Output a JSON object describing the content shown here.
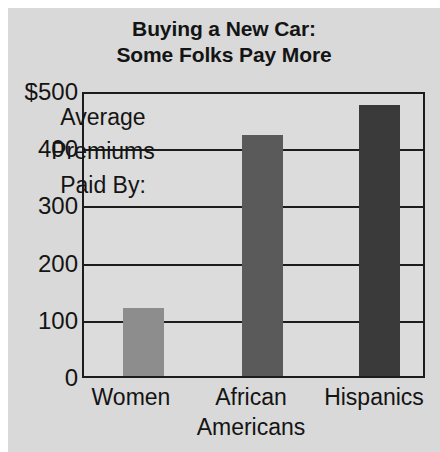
{
  "chart_data": {
    "type": "bar",
    "title": "Buying a New Car: Some Folks Pay More",
    "title_line1": "Buying a New Car:",
    "title_line2": "Some Folks Pay More",
    "categories": [
      "Women",
      "African Americans",
      "Hispanics"
    ],
    "category_lines": [
      [
        "Women"
      ],
      [
        "African",
        "Americans"
      ],
      [
        "Hispanics"
      ]
    ],
    "values": [
      120,
      428,
      480
    ],
    "xlabel": "",
    "ylabel": "",
    "ylim": [
      0,
      500
    ],
    "ytick_values": [
      500,
      400,
      300,
      200,
      100,
      0
    ],
    "ytick_labels": [
      "$500",
      "400",
      "300",
      "200",
      "100",
      "0"
    ],
    "grid": true,
    "legend": false,
    "annotations": [
      {
        "text": "Average Premiums Paid By:",
        "lines": [
          "Average",
          "Premiums",
          "Paid By:"
        ]
      }
    ],
    "bar_colors": [
      "#8d8d8d",
      "#5a5a5a",
      "#3a3a3a"
    ],
    "background_color": "#d9d9d9",
    "plot_background_color": "#dcdcdc",
    "axis_color": "#1c1c1c",
    "text_color": "#141414"
  }
}
